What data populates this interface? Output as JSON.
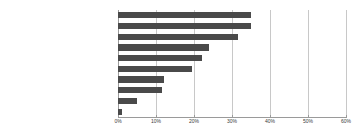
{
  "chart_data": {
    "type": "bar",
    "orientation": "horizontal",
    "title": "",
    "xlabel": "",
    "ylabel": "",
    "xlim": [
      0,
      60
    ],
    "xunit": "%",
    "grid": true,
    "legend": false,
    "bar_color": "#4a4a4a",
    "gridline_color": "#c8c8c8",
    "axis_color": "#9a9a9a",
    "xticks": [
      "0%",
      "10%",
      "20%",
      "30%",
      "40%",
      "50%",
      "60%"
    ],
    "xtick_values": [
      0,
      10,
      20,
      30,
      40,
      50,
      60
    ],
    "categories": [
      "ビジネス誌（オンライン記事を含む）",
      "その他のオンライン記事",
      "新聞記事",
      "書籍",
      "その他の雑誌（オンライン記事を含む）",
      "テレビ",
      "SNS",
      "ブログ",
      "動画サイト",
      "その他"
    ],
    "values": [
      35.0,
      35.0,
      31.5,
      24.0,
      22.0,
      19.5,
      12.0,
      11.5,
      5.0,
      1.0
    ]
  }
}
